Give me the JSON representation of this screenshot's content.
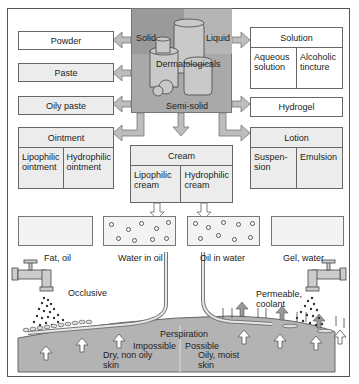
{
  "center": {
    "title": "Dermatologicals",
    "solid_label": "Solid",
    "liquid_label": "Liquid",
    "semisolid_label": "Semi-solid"
  },
  "left_boxes": [
    {
      "label": "Powder"
    },
    {
      "label": "Paste"
    },
    {
      "label": "Oily paste"
    }
  ],
  "ointment": {
    "title": "Ointment",
    "cells": [
      "Lipophilic ointment",
      "Hydrophilic ointment"
    ]
  },
  "solution": {
    "title": "Solution",
    "cells": [
      "Aqueous solution",
      "Alcoholic tincture"
    ]
  },
  "hydrogel": {
    "label": "Hydrogel"
  },
  "lotion": {
    "title": "Lotion",
    "cells": [
      "Suspen- sion",
      "Emulsion"
    ]
  },
  "cream": {
    "title": "Cream",
    "cells": [
      "Lipophilic cream",
      "Hydrophilic cream"
    ]
  },
  "bases": [
    {
      "label": "Fat, oil"
    },
    {
      "label": "Water in oil"
    },
    {
      "label": "Oil in water"
    },
    {
      "label": "Gel, water"
    }
  ],
  "effects": {
    "left": "Occlusive",
    "right": "Permeable, coolant"
  },
  "skin": {
    "perspiration": "Perspiration",
    "left_state": "Impossible",
    "right_state": "Possible",
    "left_type": "Dry, non oily skin",
    "right_type": "Oily, moist skin"
  },
  "colors": {
    "arrow": "#bdbdbd",
    "center": "#a9a9a9",
    "skin": "#b3b3b3",
    "box_grey": "#ececec"
  }
}
